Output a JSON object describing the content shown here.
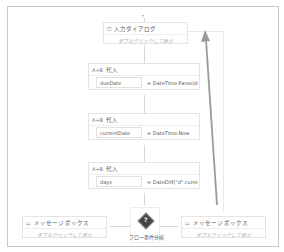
{
  "canvas": {
    "start_arrow": "▾",
    "input_dialog": {
      "title": "入力ダイアログ",
      "hint": "ダブルクリックして表示",
      "icon": "dialog-icon"
    },
    "assigns": [
      {
        "title": "代入",
        "icon_text": "A+B",
        "variable": "dueDate",
        "value": "= DateTime.Parse(du"
      },
      {
        "title": "代入",
        "icon_text": "A+B",
        "variable": "currentDate",
        "value": "= DateTime.Now"
      },
      {
        "title": "代入",
        "icon_text": "A+B",
        "variable": "days",
        "value": "= DateDiff(\"d\",curren"
      }
    ],
    "flow_decision": {
      "label": "フロー条件分岐",
      "icon_text": "?"
    },
    "message_left": {
      "title": "メッセージ ボックス",
      "hint": "ダブルクリックして表示"
    },
    "message_right": {
      "title": "メッセージ ボックス",
      "hint": "ダブルクリックして表示"
    }
  },
  "colors": {
    "border": "#c8c8c8",
    "connector": "#d6d6d6",
    "loop_arrow": "#9a9a9a"
  }
}
